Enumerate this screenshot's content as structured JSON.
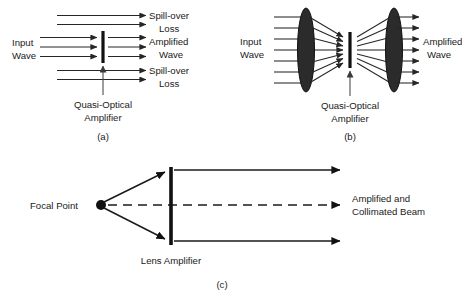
{
  "figure": {
    "background_color": "#ffffff",
    "ink_color": "#1a1a1a",
    "lens_fill_color": "#2b2b2b"
  },
  "panels": [
    {
      "id": "a",
      "caption": "(a)",
      "labels": {
        "input_wave_line1": "Input",
        "input_wave_line2": "Wave",
        "spill_over_top_line1": "Spill-over",
        "spill_over_top_line2": "Loss",
        "amplified_line1": "Amplified",
        "amplified_line2": "Wave",
        "spill_over_bottom_line1": "Spill-over",
        "spill_over_bottom_line2": "Loss",
        "amplifier_line1": "Quasi-Optical",
        "amplifier_line2": "Amplifier"
      },
      "counts": {
        "spill_over_top_rays": 2,
        "amplified_rays": 3,
        "spill_over_bottom_rays": 2
      }
    },
    {
      "id": "b",
      "caption": "(b)",
      "labels": {
        "input_wave_line1": "Input",
        "input_wave_line2": "Wave",
        "amplified_line1": "Amplified",
        "amplified_line2": "Wave",
        "amplifier_line1": "Quasi-Optical",
        "amplifier_line2": "Amplifier"
      },
      "counts": {
        "input_rays": 7,
        "output_rays": 7,
        "lenses": 2
      }
    },
    {
      "id": "c",
      "caption": "(c)",
      "labels": {
        "focal_point": "Focal Point",
        "lens_amplifier": "Lens Amplifier",
        "output_line1": "Amplified and",
        "output_line2": "Collimated Beam"
      },
      "counts": {
        "diverging_rays": 2,
        "output_rays": 3,
        "dashed_axis": 1
      }
    }
  ]
}
